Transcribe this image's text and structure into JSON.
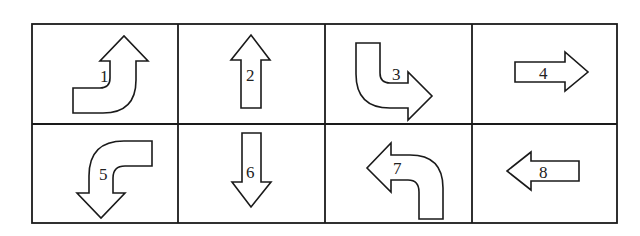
{
  "grid": {
    "rows": 2,
    "columns": 4
  },
  "cells": [
    {
      "label": "1",
      "description": "curved arrow: from left, turning up"
    },
    {
      "label": "2",
      "description": "straight arrow pointing up"
    },
    {
      "label": "3",
      "description": "curved arrow: from top, turning right"
    },
    {
      "label": "4",
      "description": "straight arrow pointing right"
    },
    {
      "label": "5",
      "description": "curved arrow: from right, turning down"
    },
    {
      "label": "6",
      "description": "straight arrow pointing down"
    },
    {
      "label": "7",
      "description": "curved arrow: from bottom, turning left"
    },
    {
      "label": "8",
      "description": "straight arrow pointing left"
    }
  ],
  "colors": {
    "stroke": "#1a1a1a",
    "fill": "#ffffff"
  }
}
